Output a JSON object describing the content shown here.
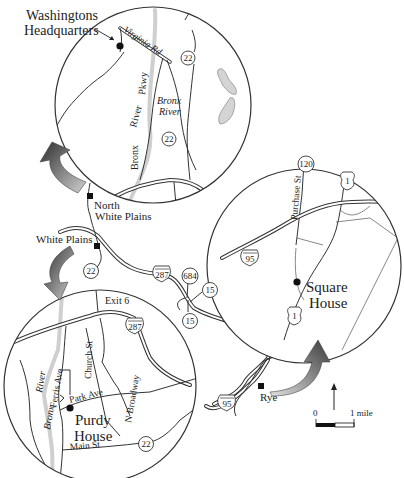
{
  "map": {
    "colors": {
      "ink": "#222222",
      "river_fill": "#cfcfcf",
      "lake_fill": "#d4d4d4",
      "arrow_dark": "#3a3a3a",
      "arrow_light": "#cfcfcf",
      "background": "#ffffff"
    },
    "top_inset": {
      "site_label_line1": "Washingtons",
      "site_label_line2": "Headquarters",
      "road_virginia": "Virginia Rd",
      "road_pkwy_word1": "Bronx",
      "road_pkwy_word2": "River",
      "road_pkwy_word3": "Pkwy",
      "river_line1": "Bronx",
      "river_line2": "River",
      "route_22_a": "22",
      "route_22_b": "22"
    },
    "right_inset": {
      "site_label_line1": "Square",
      "site_label_line2": "House",
      "road_purchase": "Purchase St",
      "route_120": "120",
      "route_1_top": "1",
      "route_1_bottom": "1",
      "route_95": "95"
    },
    "bottom_inset": {
      "site_label_line1": "Purdy",
      "site_label_line2": "House",
      "exit_label": "Exit 6",
      "route_287": "287",
      "road_church": "Church St",
      "road_ferris": "Ferris Ave",
      "road_park": "Park Ave",
      "road_broadway": "N Broadway",
      "road_main": "Main St",
      "river_word1": "River",
      "river_word2": "Bronx",
      "route_22": "22"
    },
    "overview": {
      "town_north_wp_line1": "North",
      "town_north_wp_line2": "White Plains",
      "town_white_plains": "White Plains",
      "town_rye": "Rye",
      "route_22": "22",
      "route_287": "287",
      "route_684": "684",
      "route_15_a": "15",
      "route_15_b": "15",
      "route_95": "95"
    },
    "scale_bar": {
      "start_label": "0",
      "end_label": "1 mile",
      "north_arrow": "north-arrow"
    }
  }
}
